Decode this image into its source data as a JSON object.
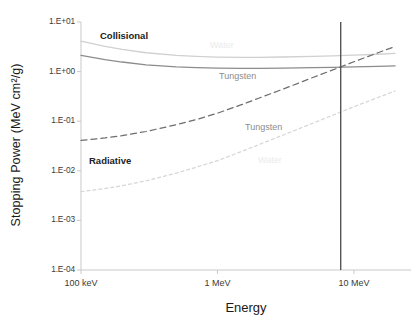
{
  "chart_data": {
    "type": "line",
    "title": "",
    "xlabel": "Energy",
    "ylabel": "Stopping Power (MeV cm2/g)",
    "ylabel_display": "Stopping Power (MeV cm²/g)",
    "xscale": "log",
    "yscale": "log",
    "xlim": [
      0.1,
      20
    ],
    "ylim": [
      0.0001,
      10
    ],
    "grid": false,
    "legend_position": "inline-annotations",
    "x_ticks": [
      {
        "value": 0.1,
        "label": "100 keV"
      },
      {
        "value": 1,
        "label": "1 MeV"
      },
      {
        "value": 10,
        "label": "10 MeV"
      }
    ],
    "y_ticks": [
      {
        "value": 10,
        "label": "1.E+01"
      },
      {
        "value": 1,
        "label": "1.E+00"
      },
      {
        "value": 0.1,
        "label": "1.E-01"
      },
      {
        "value": 0.01,
        "label": "1.E-02"
      },
      {
        "value": 0.001,
        "label": "1.E-03"
      },
      {
        "value": 0.0001,
        "label": "1.E-04"
      }
    ],
    "series": [
      {
        "name": "Collisional Water",
        "group": "Collisional",
        "material": "Water",
        "style": "solid",
        "color": "#d0d0d0",
        "x": [
          0.1,
          0.15,
          0.2,
          0.3,
          0.5,
          0.7,
          1,
          1.5,
          2,
          3,
          5,
          7,
          10,
          15,
          20
        ],
        "y": [
          4.12,
          3.24,
          2.8,
          2.4,
          2.12,
          2.03,
          1.96,
          1.93,
          1.94,
          1.97,
          2.03,
          2.08,
          2.15,
          2.24,
          2.32
        ]
      },
      {
        "name": "Collisional Tungsten",
        "group": "Collisional",
        "material": "Tungsten",
        "style": "solid",
        "color": "#8c8c8c",
        "x": [
          0.1,
          0.15,
          0.2,
          0.3,
          0.5,
          0.7,
          1,
          1.5,
          2,
          3,
          5,
          7,
          10,
          15,
          20
        ],
        "y": [
          2.12,
          1.75,
          1.56,
          1.37,
          1.24,
          1.2,
          1.17,
          1.16,
          1.16,
          1.17,
          1.2,
          1.22,
          1.25,
          1.28,
          1.3
        ]
      },
      {
        "name": "Radiative Tungsten",
        "group": "Radiative",
        "material": "Tungsten",
        "style": "dashed",
        "color": "#6e6e6e",
        "x": [
          0.1,
          0.15,
          0.2,
          0.3,
          0.5,
          0.7,
          1,
          1.5,
          2,
          3,
          5,
          7,
          10,
          15,
          20
        ],
        "y": [
          0.041,
          0.046,
          0.051,
          0.062,
          0.085,
          0.108,
          0.145,
          0.215,
          0.29,
          0.44,
          0.76,
          1.08,
          1.58,
          2.4,
          3.2
        ]
      },
      {
        "name": "Radiative Water",
        "group": "Radiative",
        "material": "Water",
        "style": "dotted",
        "color": "#d6d6d6",
        "x": [
          0.1,
          0.15,
          0.2,
          0.3,
          0.5,
          0.7,
          1,
          1.5,
          2,
          3,
          5,
          7,
          10,
          15,
          20
        ],
        "y": [
          0.0038,
          0.0044,
          0.005,
          0.0063,
          0.009,
          0.0118,
          0.016,
          0.0245,
          0.0335,
          0.052,
          0.091,
          0.132,
          0.196,
          0.3,
          0.405
        ]
      }
    ],
    "annotations": [
      {
        "text": "Collisional",
        "x_px": 100,
        "y_px": 30,
        "style": "bold"
      },
      {
        "text": "Radiative",
        "x_px": 89,
        "y_px": 155,
        "style": "bold"
      },
      {
        "text": "Tungsten",
        "x_px": 219,
        "y_px": 71,
        "style": "dark"
      },
      {
        "text": "Tungsten",
        "x_px": 245,
        "y_px": 122,
        "style": "dark"
      },
      {
        "text": "Water",
        "x_px": 210,
        "y_px": 40,
        "style": "faint"
      },
      {
        "text": "Water",
        "x_px": 258,
        "y_px": 155,
        "style": "faint"
      }
    ],
    "vertical_marker": {
      "x_value": 8.0,
      "color": "#555555",
      "label": ""
    }
  }
}
